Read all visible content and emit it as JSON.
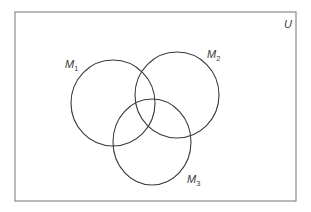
{
  "diagram": {
    "type": "venn",
    "universe": {
      "label": "U",
      "box": {
        "x": 15,
        "y": 12,
        "width": 281,
        "height": 189
      }
    },
    "sets": [
      {
        "id": "M1",
        "base": "M",
        "subscript": "1",
        "cx": 113,
        "cy": 103,
        "rx": 42,
        "ry": 43,
        "label_x": 65,
        "label_y": 68,
        "sub_dx": 0,
        "sub_dy": 3
      },
      {
        "id": "M2",
        "base": "M",
        "subscript": "2",
        "cx": 177,
        "cy": 95,
        "rx": 42,
        "ry": 43,
        "label_x": 207,
        "label_y": 58,
        "sub_dx": 0,
        "sub_dy": 3
      },
      {
        "id": "M3",
        "base": "M",
        "subscript": "3",
        "cx": 152,
        "cy": 142,
        "rx": 39,
        "ry": 43,
        "label_x": 187,
        "label_y": 183,
        "sub_dx": 0,
        "sub_dy": 3
      }
    ],
    "colors": {
      "border": "#8a8a8a",
      "stroke": "#3a3a3a",
      "background": "#ffffff"
    }
  }
}
